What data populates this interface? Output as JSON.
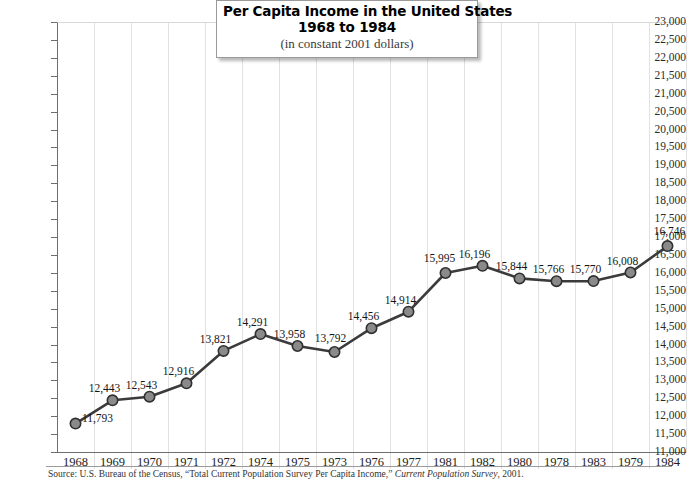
{
  "chart_data": {
    "type": "line",
    "title": "Per Capita Income in the United States",
    "title_line2": "1968 to 1984",
    "subtitle": "(in constant 2001 dollars)",
    "xlabel": "",
    "ylabel": "",
    "ylim": [
      11000,
      23000
    ],
    "ytick_step": 500,
    "grid": "vertical",
    "legend": "none",
    "categories": [
      "1968",
      "1969",
      "1970",
      "1971",
      "1972",
      "1974",
      "1975",
      "1973",
      "1976",
      "1977",
      "1981",
      "1982",
      "1980",
      "1978",
      "1983",
      "1979",
      "1984"
    ],
    "values": [
      11793,
      12443,
      12543,
      12916,
      13821,
      14291,
      13958,
      13792,
      14456,
      14914,
      15995,
      16196,
      15844,
      15766,
      15770,
      16008,
      16746
    ],
    "value_labels": [
      "11,793",
      "12,443",
      "12,543",
      "12,916",
      "13,821",
      "14,291",
      "13,958",
      "13,792",
      "14,456",
      "14,914",
      "15,995",
      "16,196",
      "15,844",
      "15,766",
      "15,770",
      "16,008",
      "16,746"
    ],
    "ytick_labels": [
      "23,000",
      "22,500",
      "22,000",
      "21,500",
      "21,000",
      "20,500",
      "20,000",
      "19,500",
      "19,000",
      "18,500",
      "18,000",
      "17,500",
      "17,000",
      "16,500",
      "16,000",
      "15,500",
      "15,000",
      "14,500",
      "14,000",
      "13,500",
      "13,000",
      "12,500",
      "12,000",
      "11,500",
      "11,000"
    ],
    "series_color": "#3b3b3b",
    "marker_fill": "#8a8a8a",
    "marker_stroke": "#303030",
    "gridline_color": "#e2e2e2"
  },
  "source": {
    "prefix": "Source: U.S. Bureau of the Census, “Total Current Population Survey Per Capita Income,” ",
    "italic": "Current Population Survey",
    "suffix": ", 2001."
  }
}
